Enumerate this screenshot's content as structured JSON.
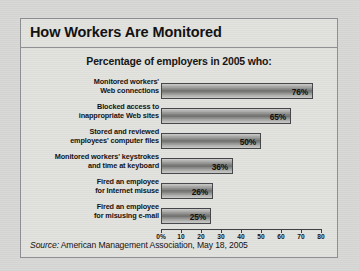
{
  "figure": {
    "title": "How Workers Are Monitored",
    "subtitle": "Percentage of employers in 2005 who:",
    "source_word": "Source:",
    "source_text": " American Management Association, May 18, 2005",
    "frame_color": "#8d8f92",
    "panel_color": "#e2e2df",
    "bar_outline_color": "#44464a"
  },
  "chart_data": {
    "type": "bar",
    "orientation": "horizontal",
    "title": "How Workers Are Monitored",
    "subtitle": "Percentage of employers in 2005 who:",
    "xlabel": "",
    "ylabel": "",
    "xlim": [
      0,
      80
    ],
    "grid": false,
    "legend": null,
    "categories": [
      "Monitored workers' Web connections",
      "Blocked access to inappropriate Web sites",
      "Stored and reviewed employees' computer files",
      "Monitored workers' keystrokes and time at keyboard",
      "Fired an employee for Internet misuse",
      "Fired an employee for misusing e-mail"
    ],
    "category_lines": [
      [
        "Monitored workers'",
        "Web connections"
      ],
      [
        "Blocked access to",
        "inappropriate Web sites"
      ],
      [
        "Stored and reviewed",
        "employees' computer files"
      ],
      [
        "Monitored workers' keystrokes",
        "and time at keyboard"
      ],
      [
        "Fired an employee",
        "for Internet misuse"
      ],
      [
        "Fired an employee",
        "for misusing e-mail"
      ]
    ],
    "values": [
      76,
      65,
      50,
      36,
      26,
      25
    ],
    "value_labels": [
      "76%",
      "65%",
      "50%",
      "36%",
      "26%",
      "25%"
    ],
    "xticks": [
      0,
      10,
      20,
      30,
      40,
      50,
      60,
      70,
      80
    ],
    "xtick_labels": [
      "0%",
      "10",
      "20",
      "30",
      "40",
      "50",
      "60",
      "70",
      "80"
    ]
  }
}
